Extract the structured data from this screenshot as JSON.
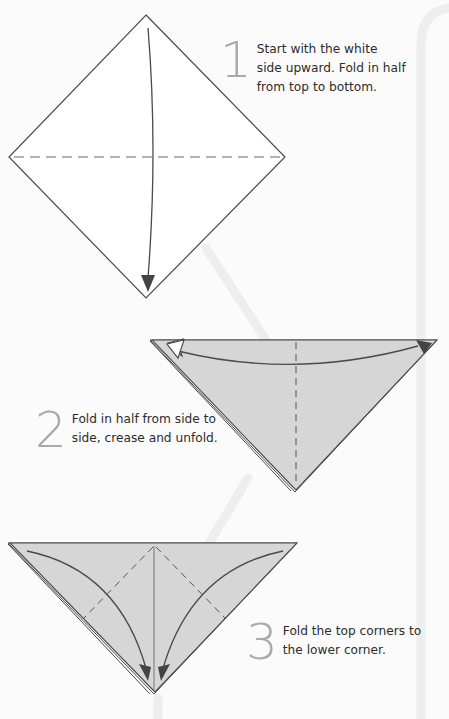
{
  "steps": [
    {
      "number": "1",
      "text": "Start with the white\nside upward. Fold in half\nfrom top to bottom."
    },
    {
      "number": "2",
      "text": "Fold in half from side to\nside, crease and unfold."
    },
    {
      "number": "3",
      "text": "Fold the top corners to\nthe lower corner."
    }
  ],
  "colors": {
    "background": "#fbfbfb",
    "paper_white": "#ffffff",
    "paper_colored": "#d6d6d6",
    "line": "#4a4a4a",
    "number_gray": "#a9a9a9",
    "band": "#efefef"
  }
}
